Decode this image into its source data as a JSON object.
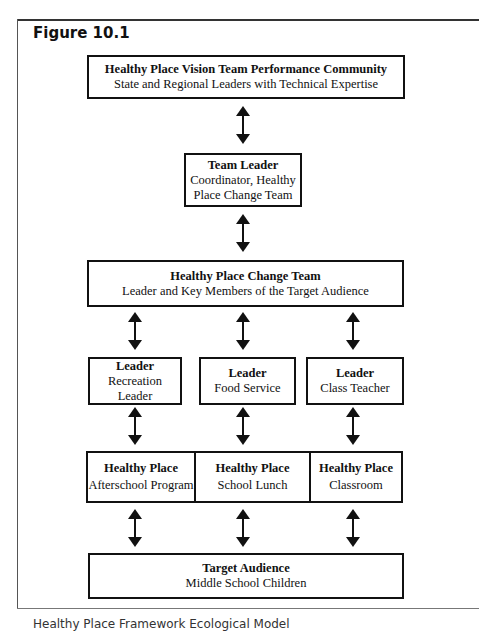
{
  "figure": {
    "title": "Figure 10.1",
    "caption": "Healthy Place Framework Ecological Model"
  },
  "nodes": {
    "vision_team": {
      "title": "Healthy Place Vision Team Performance Community",
      "subtitle": "State and Regional Leaders with Technical Expertise"
    },
    "team_leader": {
      "title": "Team Leader",
      "subtitle_line1": "Coordinator, Healthy",
      "subtitle_line2": "Place Change Team"
    },
    "change_team": {
      "title": "Healthy Place Change Team",
      "subtitle": "Leader and Key Members of the Target Audience"
    },
    "leaders": [
      {
        "title": "Leader",
        "subtitle": "Recreation Leader"
      },
      {
        "title": "Leader",
        "subtitle": "Food Service"
      },
      {
        "title": "Leader",
        "subtitle": "Class Teacher"
      }
    ],
    "places": [
      {
        "title": "Healthy Place",
        "subtitle": "Afterschool Program"
      },
      {
        "title": "Healthy Place",
        "subtitle": "School Lunch"
      },
      {
        "title": "Healthy Place",
        "subtitle": "Classroom"
      }
    ],
    "target_audience": {
      "title": "Target Audience",
      "subtitle": "Middle School Children"
    }
  },
  "edges": [
    {
      "from": "vision_team",
      "to": "team_leader",
      "type": "bidirectional"
    },
    {
      "from": "team_leader",
      "to": "change_team",
      "type": "bidirectional"
    },
    {
      "from": "change_team",
      "to": "leaders.0",
      "type": "bidirectional"
    },
    {
      "from": "change_team",
      "to": "leaders.1",
      "type": "bidirectional"
    },
    {
      "from": "change_team",
      "to": "leaders.2",
      "type": "bidirectional"
    },
    {
      "from": "leaders.0",
      "to": "places.0",
      "type": "bidirectional"
    },
    {
      "from": "leaders.1",
      "to": "places.1",
      "type": "bidirectional"
    },
    {
      "from": "leaders.2",
      "to": "places.2",
      "type": "bidirectional"
    },
    {
      "from": "places.0",
      "to": "target_audience",
      "type": "bidirectional"
    },
    {
      "from": "places.1",
      "to": "target_audience",
      "type": "bidirectional"
    },
    {
      "from": "places.2",
      "to": "target_audience",
      "type": "bidirectional"
    }
  ],
  "colors": {
    "line": "#111111",
    "background": "#ffffff"
  }
}
